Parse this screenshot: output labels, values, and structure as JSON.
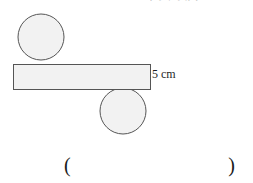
{
  "page": {
    "background_color": "#ffffff",
    "width": 253,
    "height": 183
  },
  "clipped_top_expression": {
    "text": "( 2 + 2  4 ),",
    "note": "partially cut off at top edge of screenshot"
  },
  "figure": {
    "name": "rectangle-with-two-circles",
    "fill_color": "#f2f2f2",
    "stroke_color": "#555555",
    "rectangle": {
      "x": 13,
      "y": 64,
      "width": 137,
      "height": 26
    },
    "circle_top": {
      "cx": 41,
      "cy": 37,
      "r": 23
    },
    "circle_bottom": {
      "cx": 123,
      "cy": 111,
      "r": 23
    },
    "dimension_label": "5 cm"
  },
  "answer": {
    "open_paren": "(",
    "close_paren": ")",
    "value": ""
  }
}
